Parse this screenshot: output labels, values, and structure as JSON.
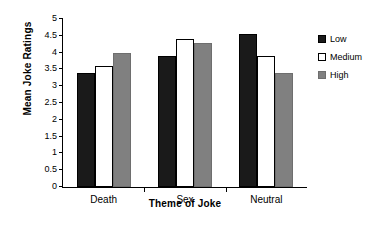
{
  "chart_data": {
    "type": "bar",
    "title": "",
    "xlabel": "Theme of Joke",
    "ylabel": "Mean Joke Ratings",
    "categories": [
      "Death",
      "Sex",
      "Neutral"
    ],
    "series": [
      {
        "name": "Low",
        "color": "#1a1a1a",
        "values": [
          3.4,
          3.9,
          4.55
        ]
      },
      {
        "name": "Medium",
        "color": "#ffffff",
        "values": [
          3.6,
          4.4,
          3.9
        ]
      },
      {
        "name": "High",
        "color": "#808080",
        "values": [
          4.0,
          4.3,
          3.4
        ]
      }
    ],
    "ylim": [
      0,
      5
    ],
    "yticks": [
      "0",
      "0.5",
      "1",
      "1.5",
      "2",
      "2.5",
      "3",
      "3.5",
      "4",
      "4.5",
      "5"
    ],
    "ytick_values": [
      0,
      0.5,
      1,
      1.5,
      2,
      2.5,
      3,
      3.5,
      4,
      4.5,
      5
    ],
    "grid": false,
    "legend_position": "right"
  }
}
